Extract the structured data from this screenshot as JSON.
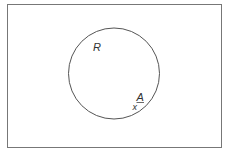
{
  "diagram": {
    "type": "venn",
    "universe": {
      "label": ""
    },
    "region": {
      "label": "R"
    },
    "point": {
      "label": "A",
      "marker": "x"
    },
    "colors": {
      "stroke": "#555555",
      "text": "#333333",
      "background": "#ffffff"
    }
  }
}
